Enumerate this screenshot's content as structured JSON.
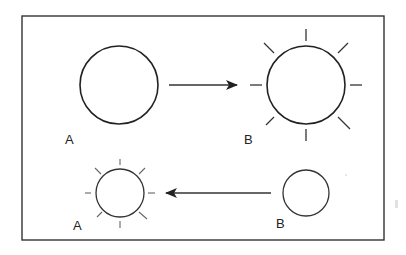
{
  "diagram": {
    "colors": {
      "stroke": "#222222",
      "background": "#ffffff"
    },
    "top_row": {
      "left_label": "A",
      "right_label": "B",
      "arrow_direction": "A-to-B",
      "left_state": "plain-circle",
      "right_state": "radiating-circle"
    },
    "bottom_row": {
      "left_label": "A",
      "right_label": "B",
      "arrow_direction": "B-to-A",
      "left_state": "radiating-circle",
      "right_state": "plain-circle"
    }
  }
}
